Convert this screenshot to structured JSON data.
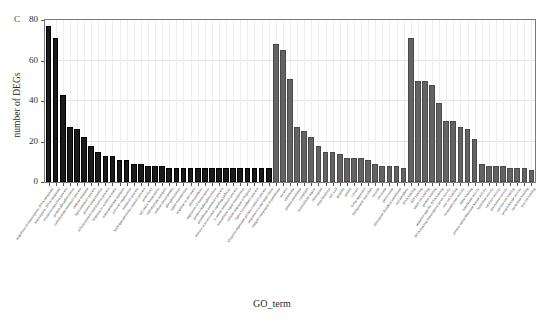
{
  "figure": {
    "panel_letter": "C",
    "xlabel": "GO_term",
    "ylabel": "number of DEGs"
  },
  "chart_data": {
    "type": "bar",
    "title": "",
    "xlabel": "GO_term",
    "ylabel": "number of DEGs",
    "ylim": [
      0,
      80
    ],
    "yticks": [
      0,
      20,
      40,
      60,
      80
    ],
    "grid": true,
    "legend": null,
    "series": [
      {
        "name": "biological process",
        "color": "#1a1a1a",
        "categories": [
          "regulation of transcription, DNA-templated",
          "transcription, DNA-templated",
          "oxidation-reduction process",
          "protein phosphorylation",
          "carbohydrate metabolic process",
          "defense response",
          "lipid metabolic process",
          "protein ubiquitination",
          "cellular protein modification process",
          "response to oxidative stress",
          "transmembrane transport",
          "cell wall organization",
          "metabolic process",
          "hydrogen peroxide catabolic process",
          "proteolysis",
          "cell redox homeostasis",
          "carbohydrate transport",
          "embryo development",
          "phosphorylation",
          "signal transduction",
          "response to salt stress",
          "photosynthesis",
          "regulation of transcription",
          "protein dephosphorylation",
          "glutathione metabolic process",
          "abscisic acid-activated signaling pathway",
          "L-serine metabolic process",
          "intracellular signal transduction",
          "cellular response to hypoxia",
          "lignin biosynthetic process",
          "ubiquitin-dependent protein catabolic process",
          "response to water deprivation"
        ],
        "values": [
          77,
          71,
          43,
          27,
          26,
          22,
          18,
          15,
          13,
          13,
          11,
          11,
          9,
          9,
          8,
          8,
          8,
          7,
          7,
          7,
          7,
          7,
          7,
          7,
          7,
          7,
          7,
          7,
          7,
          7,
          7,
          7
        ]
      },
      {
        "name": "cellular component",
        "color": "#636363",
        "categories": [
          "integral component of membrane",
          "nucleus",
          "membrane",
          "plasma membrane",
          "cytoplasm",
          "extracellular region",
          "chloroplast",
          "mitochondrion",
          "cell wall",
          "apoplast",
          "plastid",
          "cytosol",
          "Golgi apparatus",
          "endoplasmic reticulum",
          "vacuole",
          "ribosome",
          "peroxisome",
          "chloroplast thylakoid membrane",
          "cell periphery"
        ],
        "values": [
          68,
          65,
          51,
          27,
          25,
          22,
          18,
          15,
          15,
          14,
          12,
          12,
          12,
          11,
          9,
          8,
          8,
          8,
          7
        ]
      },
      {
        "name": "molecular function",
        "color": "#636363",
        "categories": [
          "DNA binding",
          "ATP binding",
          "metal ion binding",
          "protein binding",
          "sequence-specific DNA binding",
          "DNA-binding transcription factor activity",
          "zinc ion binding",
          "oxidoreductase activity",
          "heme binding",
          "transferase activity",
          "protein serine/threonine kinase activity",
          "hydrolase activity",
          "catalytic activity",
          "peroxidase activity",
          "calcium ion binding",
          "protein kinase activity",
          "nucleotide binding",
          "iron ion binding"
        ],
        "values": [
          71,
          50,
          50,
          48,
          39,
          30,
          30,
          27,
          26,
          21,
          9,
          8,
          8,
          8,
          7,
          7,
          7,
          6
        ]
      }
    ]
  }
}
